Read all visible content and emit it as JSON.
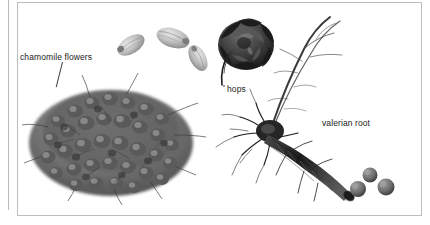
{
  "figure": {
    "kind": "botanical-specimen-photograph",
    "background_color": "#ffffff",
    "border_color": "#bdbdbd",
    "running_head": "",
    "labels": [
      {
        "id": "chamomile",
        "text": "chamomile flowers",
        "x": 20,
        "y": 52
      },
      {
        "id": "hops",
        "text": "hops",
        "x": 227,
        "y": 84
      },
      {
        "id": "valerian",
        "text": "valerian root",
        "x": 322,
        "y": 118
      }
    ],
    "specimens": [
      {
        "id": "hop-grains",
        "name": "hop grains",
        "description": "three pale oval dried hop grains scattered near the top",
        "count": 3
      },
      {
        "id": "chamomile-pile",
        "name": "chamomile flowers",
        "description": "dense mound of small dried chamomile flower heads with stems"
      },
      {
        "id": "hop-cone",
        "name": "hops",
        "description": "single dark hop cone with a curving stem"
      },
      {
        "id": "valerian-root",
        "name": "valerian root",
        "description": "branched valerian rhizome with fine trailing rootlets"
      },
      {
        "id": "pellets",
        "name": "pellets",
        "description": "three small round grey pellets at the lower right",
        "count": 3
      }
    ],
    "colors": {
      "ink": "#1b1b1b",
      "rule": "#b9b9b9",
      "leader": "#3a3a3a",
      "specimen_dark": "#2a2a2a",
      "specimen_mid": "#7d7d7d",
      "specimen_light": "#c6c6c6"
    }
  }
}
